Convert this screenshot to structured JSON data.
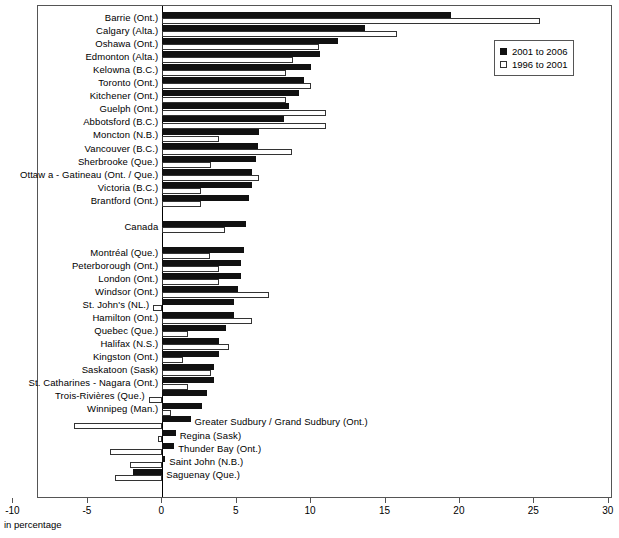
{
  "chart_data": {
    "type": "bar",
    "orientation": "horizontal",
    "title": "",
    "xlabel": "in percentage",
    "ylabel": "",
    "xlim": [
      -10,
      30
    ],
    "xticks": [
      -10,
      -5,
      0,
      5,
      10,
      15,
      20,
      25,
      30
    ],
    "xtick_labels": [
      "-10",
      "-5",
      "0",
      "5",
      "10",
      "15",
      "20",
      "25",
      "30"
    ],
    "grid": false,
    "legend_position": "top-right",
    "legend": [
      "2001 to 2006",
      "1996 to 2001"
    ],
    "series": [
      {
        "name": "2001 to 2006",
        "color": "#111111",
        "values": [
          19.4,
          13.6,
          11.8,
          10.6,
          10.0,
          9.5,
          9.2,
          8.5,
          8.2,
          6.5,
          6.4,
          6.3,
          6.0,
          6.0,
          5.8,
          5.6,
          5.5,
          5.3,
          5.3,
          5.1,
          4.8,
          4.8,
          4.3,
          3.8,
          3.8,
          3.5,
          3.5,
          3.0,
          2.7,
          1.9,
          0.9,
          0.8,
          0.2,
          -2.0
        ]
      },
      {
        "name": "1996 to 2001",
        "color": "#ffffff",
        "values": [
          25.4,
          15.8,
          10.5,
          8.8,
          8.3,
          10.0,
          8.3,
          11.0,
          11.0,
          3.8,
          8.7,
          3.3,
          6.5,
          2.6,
          2.6,
          4.2,
          3.2,
          3.8,
          3.8,
          7.2,
          -0.6,
          6.0,
          1.7,
          4.5,
          1.4,
          3.3,
          1.7,
          -0.9,
          0.6,
          -5.9,
          -0.3,
          -3.5,
          -2.2,
          -3.2
        ]
      }
    ],
    "categories": [
      "Barrie (Ont.)",
      "Calgary (Alta.)",
      "Oshawa (Ont.)",
      "Edmonton (Alta.)",
      "Kelowna (B.C.)",
      "Toronto (Ont.)",
      "Kitchener (Ont.)",
      "Guelph (Ont.)",
      "Abbotsford (B.C.)",
      "Moncton (N.B.)",
      "Vancouver (B.C.)",
      "Sherbrooke (Que.)",
      "Ottaw a - Gatineau (Ont. / Que.)",
      "Victoria (B.C.)",
      "Brantford (Ont.)",
      "Canada",
      "Montréal (Que.)",
      "Peterborough (Ont.)",
      "London (Ont.)",
      "Windsor (Ont.)",
      "St. John's (NL.)",
      "Hamilton (Ont.)",
      "Quebec (Que.)",
      "Halifax (N.S.)",
      "Kingston (Ont.)",
      "Saskatoon (Sask)",
      "St. Catharines - Nagara (Ont.)",
      "Trois-Rivières (Que.)",
      "Winnipeg (Man.)",
      "Greater Sudbury / Grand Sudbury (Ont.)",
      "Regina (Sask)",
      "Thunder Bay (Ont.)",
      "Saint John (N.B.)",
      "Saguenay (Que.)"
    ],
    "label_side": [
      "left",
      "left",
      "left",
      "left",
      "left",
      "left",
      "left",
      "left",
      "left",
      "left",
      "left",
      "left",
      "left",
      "left",
      "left",
      "left",
      "left",
      "left",
      "left",
      "left",
      "left",
      "left",
      "left",
      "left",
      "left",
      "left",
      "left",
      "left",
      "left",
      "right",
      "right",
      "right",
      "right",
      "right"
    ],
    "row_gap_after": [
      14,
      28
    ]
  },
  "axis": {
    "caption": "in percentage"
  }
}
